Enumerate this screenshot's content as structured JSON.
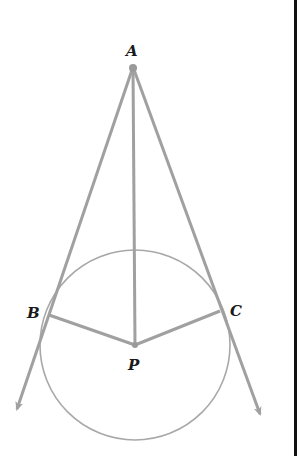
{
  "diagram": {
    "type": "geometry",
    "colors": {
      "line": "#a0a0a0",
      "circle": "#a8a8a8",
      "label": "#1a1a1a",
      "frame": "#111111"
    },
    "points": {
      "A": {
        "label": "A",
        "x": 133,
        "y": 67
      },
      "B": {
        "label": "B",
        "x": 49,
        "y": 315
      },
      "C": {
        "label": "C",
        "x": 220,
        "y": 311
      },
      "P": {
        "label": "P",
        "x": 135,
        "y": 345
      }
    },
    "circle": {
      "center": "P",
      "cx": 135,
      "cy": 345,
      "r": 95
    },
    "segments": [
      {
        "from": "A",
        "to": "P"
      },
      {
        "from": "P",
        "to": "B"
      },
      {
        "from": "P",
        "to": "C"
      }
    ],
    "rays": [
      {
        "from": "A",
        "through": "B",
        "arrow_tip": [
          16,
          412
        ]
      },
      {
        "from": "A",
        "through": "C",
        "arrow_tip": [
          262,
          418
        ]
      }
    ]
  }
}
